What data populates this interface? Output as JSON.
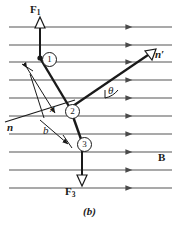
{
  "figure": {
    "caption": "(b)",
    "colors": {
      "ink": "#1a1a1a",
      "field_line": "#555555",
      "background": "#ffffff"
    },
    "field": {
      "label": "B",
      "line_count": 10,
      "direction": "right",
      "arrowhead": "right-triangle"
    },
    "forces": [
      {
        "key": "F1",
        "label": "F",
        "subscript": "1",
        "direction": "up",
        "arrowhead": "hollow-triangle"
      },
      {
        "key": "F3",
        "label": "F",
        "subscript": "3",
        "direction": "down",
        "arrowhead": "hollow-triangle"
      }
    ],
    "normals": [
      {
        "key": "n",
        "label": "n",
        "style": "bold-italic",
        "position": "lower-left"
      },
      {
        "key": "np",
        "label": "n′",
        "style": "bold-italic",
        "position": "upper-right",
        "arrowhead": "hollow-triangle"
      }
    ],
    "angle": {
      "symbol": "θ",
      "marker": "arc"
    },
    "dimensions": [
      {
        "key": "x",
        "label": "x",
        "style": "italic"
      },
      {
        "key": "b",
        "label": "b",
        "style": "italic"
      }
    ],
    "vertices": [
      {
        "id": 1,
        "label": "①",
        "text": "1"
      },
      {
        "id": 2,
        "label": "②",
        "text": "2"
      },
      {
        "id": 3,
        "label": "③",
        "text": "3"
      }
    ]
  }
}
